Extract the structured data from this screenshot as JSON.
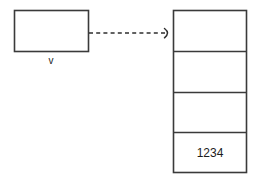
{
  "diagram": {
    "background_color": "#ffffff",
    "stroke_color": "#3a3a3a",
    "text_color": "#1c1c1c",
    "source_box": {
      "label": "v",
      "value": "",
      "name": "source-variable-box"
    },
    "connector": {
      "style": "dashed",
      "arrowhead": "open-caret",
      "direction": "left-to-right",
      "label": ""
    },
    "target_table": {
      "name": "memory-cell-column",
      "cells": [
        {
          "value": "",
          "index": 0
        },
        {
          "value": "",
          "index": 1
        },
        {
          "value": "",
          "index": 2
        },
        {
          "value": "1234",
          "index": 3
        }
      ]
    }
  }
}
